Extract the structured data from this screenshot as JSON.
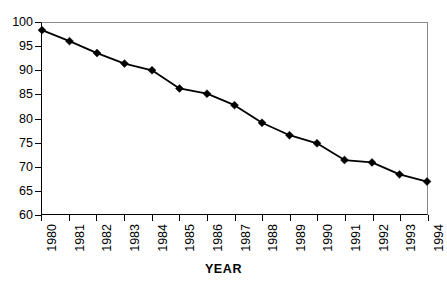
{
  "chart_data": {
    "type": "line",
    "title": "",
    "xlabel": "YEAR",
    "ylabel": "",
    "categories": [
      "1980",
      "1981",
      "1982",
      "1983",
      "1984",
      "1985",
      "1986",
      "1987",
      "1988",
      "1989",
      "1990",
      "1991",
      "1992",
      "1993",
      "1994"
    ],
    "values": [
      98.5,
      96.2,
      93.7,
      91.5,
      90.1,
      86.3,
      85.2,
      82.8,
      79.1,
      76.5,
      74.8,
      71.3,
      70.8,
      68.3,
      66.8
    ],
    "series": [
      {
        "name": "",
        "values": [
          98.5,
          96.2,
          93.7,
          91.5,
          90.1,
          86.3,
          85.2,
          82.8,
          79.1,
          76.5,
          74.8,
          71.3,
          70.8,
          68.3,
          66.8
        ]
      }
    ],
    "ylim": [
      60,
      100
    ],
    "yticks": [
      60,
      65,
      70,
      75,
      80,
      85,
      90,
      95,
      100
    ],
    "ytick_labels": [
      "60",
      "65",
      "70",
      "75",
      "80",
      "85",
      "90",
      "95",
      "100"
    ],
    "xlim": [
      1980,
      1994
    ],
    "grid": false,
    "legend": null,
    "legend_position": "none",
    "line_color": "#000000",
    "marker": "diamond",
    "marker_color": "#000000",
    "background_color": "#ffffff",
    "axis_color": "#000000",
    "frame_color": "#8a8a8a",
    "xtick_rotation": -90
  }
}
